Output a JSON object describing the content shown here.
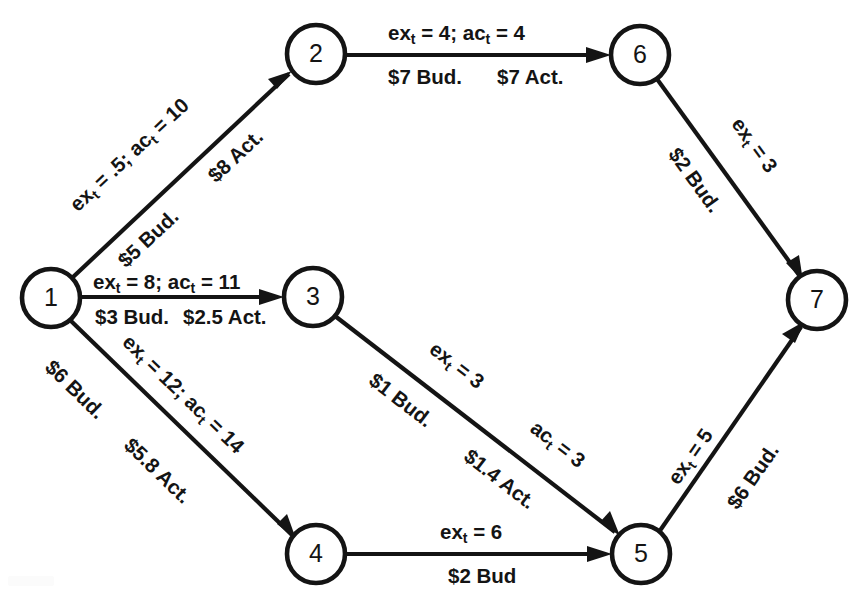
{
  "diagram": {
    "type": "directed-network",
    "canvas": {
      "width": 862,
      "height": 598
    },
    "background_color": "#ffffff",
    "stroke_color": "#141414",
    "nodes": [
      {
        "id": "1",
        "label": "1",
        "cx": 51,
        "cy": 298,
        "r": 29
      },
      {
        "id": "2",
        "label": "2",
        "cx": 316,
        "cy": 54,
        "r": 29
      },
      {
        "id": "3",
        "label": "3",
        "cx": 313,
        "cy": 297,
        "r": 29
      },
      {
        "id": "4",
        "label": "4",
        "cx": 316,
        "cy": 554,
        "r": 29
      },
      {
        "id": "5",
        "label": "5",
        "cx": 641,
        "cy": 554,
        "r": 29
      },
      {
        "id": "6",
        "label": "6",
        "cx": 640,
        "cy": 55,
        "r": 29
      },
      {
        "id": "7",
        "label": "7",
        "cx": 817,
        "cy": 300,
        "r": 29
      }
    ],
    "edges": [
      {
        "id": "e1-2",
        "from": "1",
        "to": "2",
        "time_label": "ex_t = .5; ac_t = 10",
        "cost_labels": [
          "$5 Bud.",
          "$8 Act."
        ],
        "expected_time": 0.5,
        "actual_time": 10,
        "budgeted_cost": 5,
        "actual_cost": 8
      },
      {
        "id": "e1-3",
        "from": "1",
        "to": "3",
        "time_label": "ex_t = 8; ac_t = 11",
        "cost_labels": [
          "$3 Bud.",
          "$2.5 Act."
        ],
        "expected_time": 8,
        "actual_time": 11,
        "budgeted_cost": 3,
        "actual_cost": 2.5
      },
      {
        "id": "e1-4",
        "from": "1",
        "to": "4",
        "time_label": "ex_t = 12; ac_t = 14",
        "cost_labels": [
          "$6 Bud.",
          "$5.8 Act."
        ],
        "expected_time": 12,
        "actual_time": 14,
        "budgeted_cost": 6,
        "actual_cost": 5.8
      },
      {
        "id": "e2-6",
        "from": "2",
        "to": "6",
        "time_label": "ex_t = 4; ac_t = 4",
        "cost_labels": [
          "$7 Bud.",
          "$7 Act."
        ],
        "expected_time": 4,
        "actual_time": 4,
        "budgeted_cost": 7,
        "actual_cost": 7
      },
      {
        "id": "e3-5",
        "from": "3",
        "to": "5",
        "time_label": "ex_t = 3",
        "time_label_2": "ac_t = 3",
        "cost_labels": [
          "$1 Bud.",
          "$1.4 Act."
        ],
        "expected_time": 3,
        "actual_time": 3,
        "budgeted_cost": 1,
        "actual_cost": 1.4
      },
      {
        "id": "e4-5",
        "from": "4",
        "to": "5",
        "time_label": "ex_t = 6",
        "cost_labels": [
          "$2 Bud"
        ],
        "expected_time": 6,
        "actual_time": null,
        "budgeted_cost": 2,
        "actual_cost": null
      },
      {
        "id": "e5-7",
        "from": "5",
        "to": "7",
        "time_label": "ex_t = 5",
        "cost_labels": [
          "$6 Bud."
        ],
        "expected_time": 5,
        "actual_time": null,
        "budgeted_cost": 6,
        "actual_cost": null
      },
      {
        "id": "e6-7",
        "from": "6",
        "to": "7",
        "time_label": "ex_t = 3",
        "cost_labels": [
          "$2 Bud."
        ],
        "expected_time": 3,
        "actual_time": null,
        "budgeted_cost": 2,
        "actual_cost": null
      }
    ]
  },
  "labels": {
    "e1_2_time_pre": "ex",
    "e1_2_time_mid": " = .5; ac",
    "e1_2_time_post": " = 10",
    "e1_2_bud": "$5 Bud.",
    "e1_2_act": "$8 Act.",
    "e1_3_time_pre": "ex",
    "e1_3_time_mid": " = 8; ac",
    "e1_3_time_post": " = 11",
    "e1_3_bud": "$3 Bud.",
    "e1_3_act": "$2.5 Act.",
    "e1_4_time_pre": "ex",
    "e1_4_time_mid": " = 12; ac",
    "e1_4_time_post": " = 14",
    "e1_4_bud": "$6 Bud.",
    "e1_4_act": "$5.8 Act.",
    "e2_6_time_pre": "ex",
    "e2_6_time_mid": " = 4; ac",
    "e2_6_time_post": " = 4",
    "e2_6_bud": "$7 Bud.",
    "e2_6_act": "$7 Act.",
    "e3_5_time_pre": "ex",
    "e3_5_time_post": " = 3",
    "e3_5_bud": "$1 Bud.",
    "e3_5_time2_pre": "ac",
    "e3_5_time2_post": " = 3",
    "e3_5_act": "$1.4 Act.",
    "e4_5_time_pre": "ex",
    "e4_5_time_post": " = 6",
    "e4_5_bud": "$2 Bud",
    "e5_7_time_pre": "ex",
    "e5_7_time_post": " = 5",
    "e5_7_bud": "$6 Bud.",
    "e6_7_time_pre": "ex",
    "e6_7_time_post": " = 3",
    "e6_7_bud": "$2 Bud.",
    "sub_t": "t",
    "node_1": "1",
    "node_2": "2",
    "node_3": "3",
    "node_4": "4",
    "node_5": "5",
    "node_6": "6",
    "node_7": "7"
  }
}
